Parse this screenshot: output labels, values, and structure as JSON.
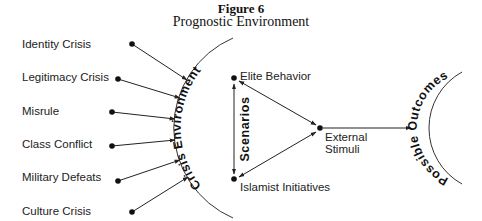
{
  "figure": {
    "number": "Figure 6",
    "title": "Prognostic Environment"
  },
  "inputs": [
    {
      "label": "Identity Crisis"
    },
    {
      "label": "Legitimacy Crisis"
    },
    {
      "label": "Misrule"
    },
    {
      "label": "Class Conflict"
    },
    {
      "label": "Military Defeats"
    },
    {
      "label": "Culture Crisis"
    }
  ],
  "crisis_arc_label": "Crisis Environment",
  "scenarios": {
    "label": "Scenarios",
    "top_node": "Elite Behavior",
    "bottom_node": "Islamist Initiatives",
    "right_node_line1": "External",
    "right_node_line2": "Stimuli"
  },
  "outcomes_arc_label": "Possible Outcomes",
  "colors": {
    "ink": "#222222",
    "background": "#ffffff"
  }
}
